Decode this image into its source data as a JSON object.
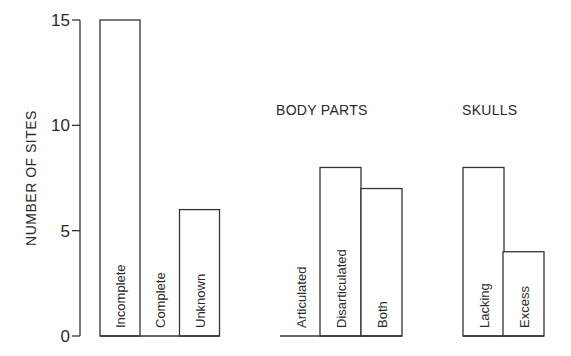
{
  "chart_data": {
    "type": "bar",
    "title": "",
    "xlabel": "",
    "ylabel": "NUMBER OF SITES",
    "ylim": [
      0,
      15
    ],
    "yticks": [
      0,
      5,
      10,
      15
    ],
    "grid": false,
    "legend": null,
    "groups": [
      {
        "title": "",
        "categories": [
          "Incomplete",
          "Complete",
          "Unknown"
        ],
        "values": [
          15,
          0,
          6
        ]
      },
      {
        "title": "BODY PARTS",
        "categories": [
          "Articulated",
          "Disarticulated",
          "Both"
        ],
        "values": [
          0,
          8,
          7
        ]
      },
      {
        "title": "SKULLS",
        "categories": [
          "Lacking",
          "Excess"
        ],
        "values": [
          8,
          4
        ]
      }
    ]
  },
  "layout": {
    "y0": 336,
    "y15": 20,
    "groups_x": [
      {
        "bars_x": [
          100,
          139.5,
          179.5
        ],
        "width": 40,
        "title_x": 0
      },
      {
        "bars_x": [
          280,
          320,
          361
        ],
        "width": 41,
        "title_x": 276,
        "title_y": 115
      },
      {
        "bars_x": [
          463,
          503
        ],
        "width": 41,
        "title_x": 462,
        "title_y": 115
      }
    ]
  }
}
